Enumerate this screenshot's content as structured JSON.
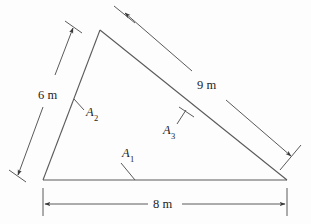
{
  "figure": {
    "type": "geometry-diagram",
    "shape": "triangle",
    "background_color": "#fdfdfd",
    "line_color": "#555555",
    "text_color": "#1d1d1d",
    "dimensions": [
      {
        "id": "side-left",
        "label": "6 m",
        "value": 6,
        "unit": "m",
        "position": "left",
        "label_x": 37,
        "label_y": 89
      },
      {
        "id": "side-hypotenuse",
        "label": "9 m",
        "value": 9,
        "unit": "m",
        "position": "upper-right",
        "label_x": 196,
        "label_y": 79
      },
      {
        "id": "side-base",
        "label": "8 m",
        "value": 8,
        "unit": "m",
        "position": "bottom",
        "label_x": 152,
        "label_y": 198
      }
    ],
    "angle_labels": [
      {
        "id": "angle-a1",
        "base": "A",
        "subscript": "1",
        "label": "A1",
        "target_side": "base",
        "label_x": 122,
        "label_y": 153
      },
      {
        "id": "angle-a2",
        "base": "A",
        "subscript": "2",
        "label": "A2",
        "target_side": "left",
        "label_x": 86,
        "label_y": 112
      },
      {
        "id": "angle-a3",
        "base": "A",
        "subscript": "3",
        "label": "A3",
        "target_side": "hypotenuse",
        "label_x": 163,
        "label_y": 124
      }
    ],
    "vertices": {
      "apex": {
        "x": 100,
        "y": 30
      },
      "bottom_left": {
        "x": 43,
        "y": 180
      },
      "bottom_right": {
        "x": 287,
        "y": 180
      }
    }
  }
}
